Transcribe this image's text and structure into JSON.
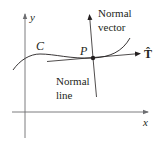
{
  "diagram": {
    "axes": {
      "x_label": "x",
      "y_label": "y"
    },
    "curve": {
      "label": "C"
    },
    "point": {
      "label": "P"
    },
    "tangent_vector": {
      "label": "T̂"
    },
    "normal_vector": {
      "line1": "Normal",
      "line2": "vector"
    },
    "normal_line": {
      "line1": "Normal",
      "line2": "line"
    },
    "colors": {
      "ink": "#231f20",
      "axis": "#6d6e71",
      "background": "#ffffff"
    }
  }
}
